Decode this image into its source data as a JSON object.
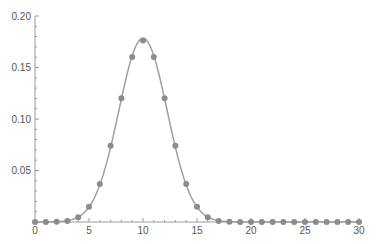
{
  "chart_data": {
    "type": "line",
    "title": "",
    "xlabel": "",
    "ylabel": "",
    "xlim": [
      0,
      30
    ],
    "ylim": [
      0,
      0.2
    ],
    "grid": false,
    "legend": null,
    "x_ticks": [
      0,
      5,
      10,
      15,
      20,
      25,
      30
    ],
    "x_tick_labels": [
      "0",
      "5",
      "10",
      "15",
      "20",
      "25",
      "30"
    ],
    "y_ticks": [
      0.05,
      0.1,
      0.15,
      0.2
    ],
    "y_tick_labels": [
      "0.05",
      "0.10",
      "0.15",
      "0.20"
    ],
    "series": [
      {
        "name": "points",
        "style": "markers+smooth-line",
        "color": "#8c8c8c",
        "line_color": "#a0a0a0",
        "x": [
          0,
          1,
          2,
          3,
          4,
          5,
          6,
          7,
          8,
          9,
          10,
          11,
          12,
          13,
          14,
          15,
          16,
          17,
          18,
          19,
          20,
          21,
          22,
          23,
          24,
          25,
          26,
          27,
          28,
          29,
          30
        ],
        "values": [
          1e-06,
          1.9e-05,
          0.000181,
          0.001087,
          0.004621,
          0.014786,
          0.036964,
          0.073929,
          0.120134,
          0.160179,
          0.176197,
          0.160179,
          0.120134,
          0.073929,
          0.036964,
          0.014786,
          0.004621,
          0.001087,
          0.000181,
          1.9e-05,
          1e-06,
          0,
          0,
          0,
          0,
          0,
          0,
          0,
          0,
          0,
          0
        ]
      }
    ]
  }
}
